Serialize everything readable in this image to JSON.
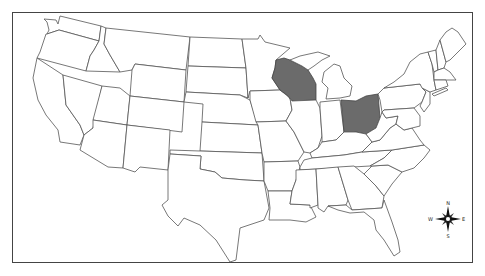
{
  "map": {
    "title": "",
    "type": "choropleth",
    "region": "United States (contiguous)",
    "highlighted_states": [
      "Wisconsin",
      "Ohio"
    ],
    "colors": {
      "highlight": "#6b6b6b",
      "default_fill": "#ffffff",
      "border": "#555555",
      "frame": "#444444"
    }
  },
  "compass": {
    "north": "N",
    "south": "S",
    "east": "E",
    "west": "W"
  }
}
